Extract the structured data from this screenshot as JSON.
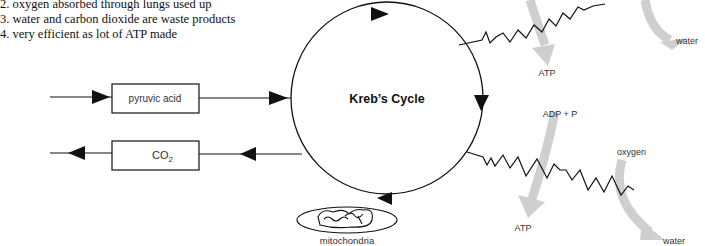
{
  "notes": [
    "2. oxygen absorbed through lungs used up",
    "3. water and carbon dioxide are waste products",
    "4. very efficient as lot of ATP made"
  ],
  "cycle": {
    "title": "Kreb’s Cycle"
  },
  "boxes": {
    "pyruvic": "pyruvic acid",
    "co2_main": "CO",
    "co2_sub": "2"
  },
  "organelle": {
    "label": "mitochondria"
  },
  "upper_chain": {
    "atp": "ATP",
    "water": "water"
  },
  "lower_chain": {
    "adp": "ADP + P",
    "oxygen": "oxygen",
    "atp": "ATP",
    "water": "water"
  },
  "colors": {
    "line": "#111111",
    "arrow_grey": "#cfcfcf",
    "label": "#333333"
  }
}
